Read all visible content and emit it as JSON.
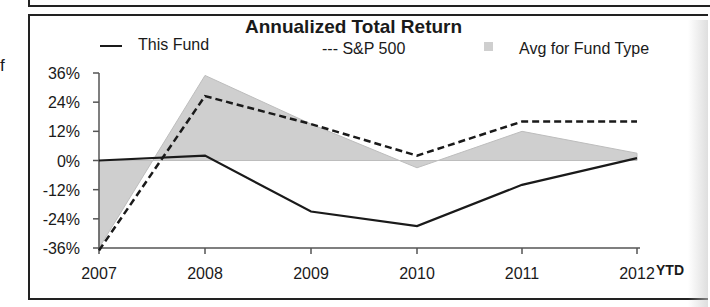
{
  "page": {
    "stray_text": "f"
  },
  "chart_data": {
    "type": "line",
    "title": "Annualized Total Return",
    "categories": [
      "2007",
      "2008",
      "2009",
      "2010",
      "2011",
      "2012"
    ],
    "x_suffix_label": "YTD",
    "xlabel": "",
    "ylabel": "",
    "y_ticks": [
      "36%",
      "24%",
      "12%",
      "0%",
      "-12%",
      "-24%",
      "-36%"
    ],
    "ylim": [
      -36,
      36
    ],
    "grid": false,
    "legend_position": "top",
    "series": [
      {
        "name": "This Fund",
        "legend_label": "— This Fund",
        "style": "solid",
        "values": [
          0,
          2,
          -21,
          -27,
          -10,
          1
        ]
      },
      {
        "name": "S&P 500",
        "legend_label": "--- S&P 500",
        "style": "dashed",
        "values": [
          -37,
          26.5,
          15,
          2,
          16,
          16
        ]
      },
      {
        "name": "Avg for Fund Type",
        "legend_label": "Avg for Fund Type",
        "style": "area",
        "values": [
          -36,
          35,
          15,
          -3,
          12,
          3
        ]
      }
    ]
  },
  "colors": {
    "line": "#1a1a1a",
    "area_fill": "#cfcfcf",
    "area_stroke": "#bdbdbd"
  }
}
